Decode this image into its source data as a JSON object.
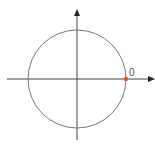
{
  "diagram": {
    "type": "unit-circle",
    "point_label": "0",
    "colors": {
      "axis": "#444444",
      "circle": "#777777",
      "point": "#e8553a",
      "label": "#555555"
    }
  }
}
